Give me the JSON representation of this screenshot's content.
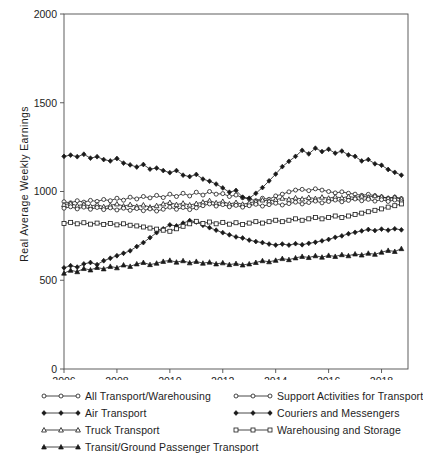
{
  "chart_data": {
    "type": "line",
    "title": "",
    "xlabel": "",
    "ylabel": "Real Average Weekly Earnings",
    "xlim": [
      2006.0,
      2019.0
    ],
    "ylim": [
      0,
      2000
    ],
    "yticks": [
      0,
      500,
      1000,
      1500,
      2000
    ],
    "xticks": [
      2006,
      2008,
      2010,
      2012,
      2014,
      2016,
      2018
    ],
    "grid": false,
    "legend_position": "below",
    "legend_columns": 2,
    "x": [
      2006.0,
      2006.25,
      2006.5,
      2006.75,
      2007.0,
      2007.25,
      2007.5,
      2007.75,
      2008.0,
      2008.25,
      2008.5,
      2008.75,
      2009.0,
      2009.25,
      2009.5,
      2009.75,
      2010.0,
      2010.25,
      2010.5,
      2010.75,
      2011.0,
      2011.25,
      2011.5,
      2011.75,
      2012.0,
      2012.25,
      2012.5,
      2012.75,
      2013.0,
      2013.25,
      2013.5,
      2013.75,
      2014.0,
      2014.25,
      2014.5,
      2014.75,
      2015.0,
      2015.25,
      2015.5,
      2015.75,
      2016.0,
      2016.25,
      2016.5,
      2016.75,
      2017.0,
      2017.25,
      2017.5,
      2017.75,
      2018.0,
      2018.25,
      2018.5,
      2018.75
    ],
    "series": [
      {
        "name": "All Transport/Warehousing",
        "marker": "open-circle",
        "fill": false,
        "values": [
          942,
          936,
          948,
          940,
          950,
          944,
          955,
          948,
          962,
          951,
          968,
          958,
          972,
          964,
          978,
          966,
          985,
          972,
          990,
          975,
          996,
          980,
          1000,
          985,
          988,
          972,
          980,
          965,
          958,
          948,
          962,
          956,
          975,
          985,
          998,
          1008,
          1012,
          1005,
          1015,
          1008,
          1000,
          992,
          998,
          990,
          985,
          978,
          984,
          976,
          970,
          962,
          968,
          960
        ]
      },
      {
        "name": "Air Transport",
        "marker": "filled-diamond",
        "fill": true,
        "values": [
          1198,
          1205,
          1196,
          1210,
          1188,
          1196,
          1180,
          1172,
          1186,
          1160,
          1150,
          1138,
          1152,
          1126,
          1132,
          1118,
          1106,
          1118,
          1092,
          1084,
          1096,
          1070,
          1058,
          1042,
          1020,
          996,
          1006,
          968,
          962,
          990,
          1022,
          1060,
          1098,
          1140,
          1170,
          1198,
          1232,
          1212,
          1244,
          1225,
          1238,
          1216,
          1228,
          1206,
          1198,
          1172,
          1180,
          1156,
          1148,
          1124,
          1108,
          1092
        ]
      },
      {
        "name": "Truck Transport",
        "marker": "open-triangle",
        "fill": false,
        "values": [
          926,
          932,
          920,
          928,
          918,
          926,
          914,
          922,
          930,
          918,
          926,
          916,
          924,
          912,
          920,
          930,
          938,
          926,
          934,
          924,
          932,
          940,
          948,
          936,
          944,
          930,
          938,
          928,
          936,
          944,
          952,
          946,
          954,
          962,
          956,
          964,
          958,
          966,
          960,
          968,
          962,
          970,
          964,
          972,
          966,
          974,
          968,
          976,
          970,
          962,
          968,
          958
        ]
      },
      {
        "name": "Transit/Ground Passenger Transport",
        "marker": "filled-triangle",
        "fill": true,
        "values": [
          540,
          556,
          548,
          566,
          558,
          572,
          564,
          578,
          570,
          586,
          578,
          592,
          600,
          588,
          596,
          606,
          612,
          602,
          610,
          598,
          606,
          596,
          602,
          592,
          598,
          588,
          594,
          586,
          592,
          600,
          610,
          604,
          612,
          622,
          616,
          626,
          634,
          628,
          638,
          630,
          640,
          634,
          644,
          638,
          648,
          642,
          652,
          646,
          658,
          668,
          662,
          678
        ]
      },
      {
        "name": "Support Activities for Transport",
        "marker": "open-circle",
        "fill": false,
        "values": [
          906,
          914,
          902,
          912,
          900,
          910,
          898,
          908,
          896,
          906,
          894,
          904,
          892,
          902,
          890,
          900,
          912,
          900,
          910,
          898,
          908,
          920,
          930,
          918,
          926,
          914,
          922,
          912,
          920,
          928,
          918,
          926,
          934,
          924,
          932,
          940,
          930,
          938,
          946,
          936,
          944,
          952,
          942,
          950,
          958,
          948,
          956,
          946,
          954,
          944,
          952,
          942
        ]
      },
      {
        "name": "Couriers and Messengers",
        "marker": "filled-diamond",
        "fill": true,
        "values": [
          570,
          582,
          574,
          592,
          600,
          588,
          610,
          624,
          638,
          652,
          666,
          690,
          712,
          740,
          768,
          790,
          812,
          806,
          822,
          836,
          828,
          810,
          796,
          782,
          768,
          756,
          744,
          738,
          726,
          718,
          712,
          704,
          698,
          704,
          698,
          706,
          700,
          708,
          714,
          722,
          730,
          742,
          750,
          762,
          770,
          778,
          786,
          780,
          788,
          782,
          790,
          784
        ]
      },
      {
        "name": "Warehousing and Storage",
        "marker": "open-square",
        "fill": false,
        "values": [
          820,
          826,
          818,
          824,
          816,
          822,
          814,
          820,
          812,
          818,
          810,
          806,
          800,
          794,
          788,
          782,
          776,
          790,
          804,
          818,
          832,
          820,
          828,
          818,
          826,
          816,
          824,
          814,
          822,
          830,
          822,
          830,
          838,
          830,
          838,
          846,
          838,
          846,
          854,
          846,
          854,
          862,
          854,
          862,
          870,
          878,
          886,
          894,
          902,
          912,
          920,
          930
        ]
      }
    ]
  },
  "legend": {
    "items": [
      {
        "label": "All Transport/Warehousing",
        "marker": "open-circle",
        "col": 0,
        "row": 0
      },
      {
        "label": "Air Transport",
        "marker": "filled-diamond",
        "col": 0,
        "row": 1
      },
      {
        "label": "Truck Transport",
        "marker": "open-triangle",
        "col": 0,
        "row": 2
      },
      {
        "label": "Transit/Ground Passenger Transport",
        "marker": "filled-triangle",
        "col": 0,
        "row": 3
      },
      {
        "label": "Support Activities for Transport",
        "marker": "open-circle",
        "col": 1,
        "row": 0
      },
      {
        "label": "Couriers and Messengers",
        "marker": "filled-diamond",
        "col": 1,
        "row": 1
      },
      {
        "label": "Warehousing and Storage",
        "marker": "open-square",
        "col": 1,
        "row": 2
      }
    ]
  },
  "colors": {
    "line": "#1a1a1a",
    "axis": "#4d4d4d",
    "text": "#1d1d1d",
    "background": "#ffffff"
  }
}
